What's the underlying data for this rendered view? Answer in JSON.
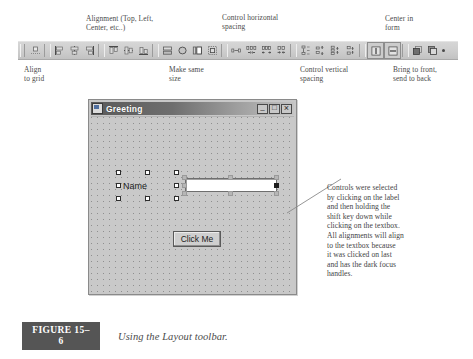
{
  "figure": {
    "badge": "FIGURE 15–6",
    "caption": "Using the Layout toolbar."
  },
  "callouts_top": [
    {
      "name": "alignment",
      "text": "Alignment (Top, Left,\nCenter, etc..)"
    },
    {
      "name": "control-horizontal-spacing",
      "text": "Control horizontal\nspacing"
    },
    {
      "name": "center-in-form",
      "text": "Center in\nform"
    }
  ],
  "callouts_bottom": [
    {
      "name": "align-to-grid",
      "text": "Align\nto grid"
    },
    {
      "name": "make-same-size",
      "text": "Make same\nsize"
    },
    {
      "name": "control-vertical-spacing",
      "text": "Control vertical\nspacing"
    },
    {
      "name": "bring-to-front-send-to-back",
      "text": "Bring to front,\nsend to back"
    }
  ],
  "toolbar": {
    "name": "layout-toolbar",
    "buttons": [
      {
        "id": "align-to-grid",
        "label": "Align to Grid"
      },
      {
        "id": "align-lefts",
        "label": "Align Lefts"
      },
      {
        "id": "align-centers",
        "label": "Align Centers"
      },
      {
        "id": "align-rights",
        "label": "Align Rights"
      },
      {
        "id": "align-tops",
        "label": "Align Tops"
      },
      {
        "id": "align-middles",
        "label": "Align Middles"
      },
      {
        "id": "align-bottoms",
        "label": "Align Bottoms"
      },
      {
        "id": "make-same-width",
        "label": "Make Same Width"
      },
      {
        "id": "make-same-height",
        "label": "Make Same Height"
      },
      {
        "id": "make-same-size",
        "label": "Make Same Size"
      },
      {
        "id": "size-to-grid",
        "label": "Size to Grid"
      },
      {
        "id": "make-horizontal-spacing-equal",
        "label": "Make Horizontal Spacing Equal"
      },
      {
        "id": "increase-horizontal-spacing",
        "label": "Increase Horizontal Spacing"
      },
      {
        "id": "decrease-horizontal-spacing",
        "label": "Decrease Horizontal Spacing"
      },
      {
        "id": "remove-horizontal-spacing",
        "label": "Remove Horizontal Spacing"
      },
      {
        "id": "make-vertical-spacing-equal",
        "label": "Make Vertical Spacing Equal"
      },
      {
        "id": "increase-vertical-spacing",
        "label": "Increase Vertical Spacing"
      },
      {
        "id": "decrease-vertical-spacing",
        "label": "Decrease Vertical Spacing"
      },
      {
        "id": "remove-vertical-spacing",
        "label": "Remove Vertical Spacing"
      },
      {
        "id": "center-horizontally",
        "label": "Center Horizontally"
      },
      {
        "id": "center-vertically",
        "label": "Center Vertically"
      },
      {
        "id": "bring-to-front",
        "label": "Bring to Front"
      },
      {
        "id": "send-to-back",
        "label": "Send to Back"
      }
    ]
  },
  "form_window": {
    "title": "Greeting",
    "window_buttons": {
      "minimize": "–",
      "maximize": "□",
      "close": "×"
    },
    "controls": {
      "label": "Name",
      "textbox_value": "",
      "button": "Click Me"
    }
  },
  "annotation": {
    "name": "selection-explanation",
    "text": "Controls were selected\nby clicking on the label\nand then holding the\nshift key down while\nclicking on the textbox.\nAll alignments will align\nto the textbox because\nit was clicked on last\nand has the dark focus\nhandles."
  },
  "colors": {
    "toolbar_face": "#cfcfcf",
    "form_face": "#c8c8c8",
    "titlebar_start": "#5a5a5a",
    "caption_badge": "#555555",
    "focus_handle": "#1c1c1c"
  }
}
